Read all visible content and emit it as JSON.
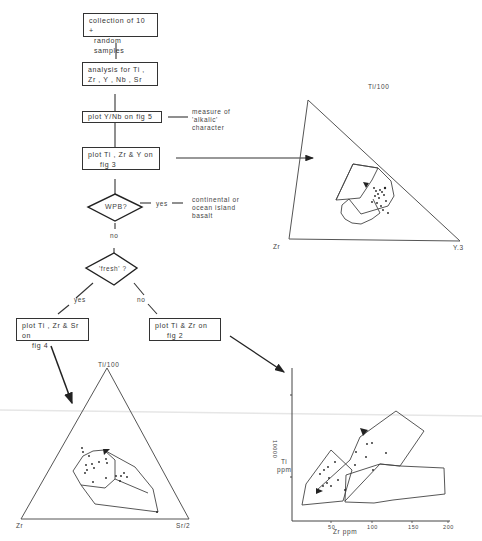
{
  "flowchart": {
    "step1": {
      "line1": "collection of 10 +",
      "line2": "random samples"
    },
    "step2": {
      "line1": "analysis for Ti ,",
      "line2": "Zr , Y , Nb , Sr"
    },
    "step3": {
      "label": "plot  Y/Nb  on fig 5"
    },
    "step3_note": {
      "line1": "measure of",
      "line2": "'alkalic'",
      "line3": "character"
    },
    "step4": {
      "line1": "plot Ti , Zr & Y on",
      "line2": "fig 3"
    },
    "decision1": {
      "label": "WPB?",
      "yes": "yes",
      "no": "no"
    },
    "decision1_outcome": {
      "line1": "continental or",
      "line2": "ocean island",
      "line3": "basalt"
    },
    "decision2": {
      "label": "'fresh' ?",
      "yes": "yes",
      "no": "no"
    },
    "step5a": {
      "line1": "plot Ti , Zr & Sr on",
      "line2": "fig 4"
    },
    "step5b": {
      "line1": "plot Ti & Zr on",
      "line2": "fig 2"
    }
  },
  "diagrams": {
    "fig3_ternary": {
      "apex_top": "Ti/100",
      "apex_left": "Zr",
      "apex_right": "Y.3"
    },
    "fig4_ternary": {
      "apex_top": "Ti/100",
      "apex_left": "Zr",
      "apex_right": "Sr/2"
    },
    "fig2_binary": {
      "ylabel_line1": "Ti",
      "ylabel_line2": "ppm",
      "ytick": "10000",
      "xlabel": "Zr ppm",
      "xticks": [
        "50",
        "100",
        "150",
        "200"
      ]
    }
  }
}
